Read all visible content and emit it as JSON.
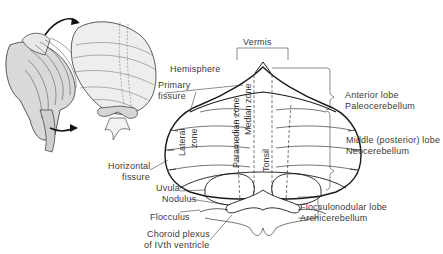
{
  "diagram": {
    "labels": {
      "vermis": "Vermis",
      "hemisphere": "Hemisphere",
      "primary_fissure": [
        "Primary",
        "fissure"
      ],
      "horizontal_fissure": [
        "Horizontal",
        "fissure"
      ],
      "uvula": "Uvula",
      "nodulus": "Nodulus",
      "flocculus": "Flocculus",
      "choroid_plexus": [
        "Choroid plexus",
        "of IVth ventricle"
      ],
      "lateral_zone": [
        "Lateral",
        "zone"
      ],
      "paramedian_zone": "Paramedian zone",
      "median_zone": "Median zone",
      "tonsil": "Tonsil"
    },
    "lobes": [
      {
        "name": "Anterior lobe",
        "subtitle": "Paleocerebellum"
      },
      {
        "name": "Middle (posterior) lobe",
        "subtitle": "Neocerebellum"
      },
      {
        "name": "Flocculonodular lobe",
        "subtitle": "Archicerebellum"
      }
    ],
    "colors": {
      "line": "#1a1a1a",
      "text": "#3a3a3a",
      "shading": "#bfbfbf"
    }
  }
}
